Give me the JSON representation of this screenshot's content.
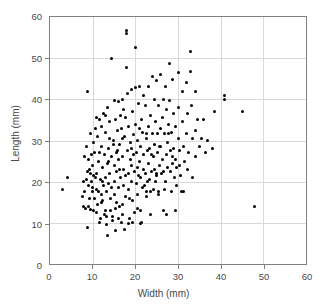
{
  "chart_data": {
    "type": "scatter",
    "title": "",
    "xlabel": "Width (mm)",
    "ylabel": "Length (mm)",
    "xlim": [
      0,
      60
    ],
    "ylim": [
      0,
      60
    ],
    "xticks": [
      0,
      10,
      20,
      30,
      40,
      50,
      60
    ],
    "yticks": [
      0,
      10,
      20,
      30,
      40,
      50,
      60
    ],
    "grid": true,
    "legend": null,
    "marker": {
      "shape": "circle",
      "color": "#000000",
      "size_px": 3
    },
    "series": [
      {
        "name": "specimens",
        "points": [
          [
            3.0,
            18.0
          ],
          [
            4.0,
            21.0
          ],
          [
            7.5,
            16.5
          ],
          [
            7.8,
            14.0
          ],
          [
            8.0,
            17.5
          ],
          [
            8.2,
            26.0
          ],
          [
            8.3,
            13.5
          ],
          [
            8.5,
            28.5
          ],
          [
            8.6,
            20.5
          ],
          [
            8.7,
            8.8
          ],
          [
            8.8,
            41.8
          ],
          [
            9.0,
            25.5
          ],
          [
            9.0,
            14.0
          ],
          [
            9.2,
            16.0
          ],
          [
            9.4,
            22.0
          ],
          [
            9.5,
            31.8
          ],
          [
            9.6,
            13.3
          ],
          [
            9.7,
            20.0
          ],
          [
            9.8,
            26.5
          ],
          [
            10.0,
            17.5
          ],
          [
            10.0,
            24.0
          ],
          [
            10.2,
            21.5
          ],
          [
            10.3,
            13.0
          ],
          [
            10.4,
            27.0
          ],
          [
            10.5,
            16.0
          ],
          [
            10.6,
            33.0
          ],
          [
            10.8,
            35.5
          ],
          [
            11.0,
            18.0
          ],
          [
            11.0,
            22.0
          ],
          [
            11.2,
            14.5
          ],
          [
            11.4,
            25.0
          ],
          [
            11.5,
            10.0
          ],
          [
            11.6,
            27.0
          ],
          [
            11.8,
            20.5
          ],
          [
            12.0,
            33.5
          ],
          [
            12.0,
            17.0
          ],
          [
            12.2,
            23.5
          ],
          [
            12.4,
            15.5
          ],
          [
            12.5,
            36.5
          ],
          [
            12.6,
            19.0
          ],
          [
            12.8,
            26.5
          ],
          [
            13.0,
            32.0
          ],
          [
            13.0,
            21.0
          ],
          [
            13.1,
            13.0
          ],
          [
            13.2,
            17.5
          ],
          [
            13.3,
            9.5
          ],
          [
            13.4,
            24.5
          ],
          [
            13.5,
            38.0
          ],
          [
            13.5,
            7.0
          ],
          [
            13.6,
            28.0
          ],
          [
            13.8,
            19.5
          ],
          [
            14.0,
            34.5
          ],
          [
            14.0,
            22.0
          ],
          [
            14.2,
            16.0
          ],
          [
            14.4,
            26.0
          ],
          [
            14.5,
            49.8
          ],
          [
            14.6,
            11.5
          ],
          [
            14.8,
            30.0
          ],
          [
            15.0,
            39.8
          ],
          [
            15.0,
            20.0
          ],
          [
            15.1,
            24.0
          ],
          [
            15.2,
            17.0
          ],
          [
            15.3,
            35.0
          ],
          [
            15.4,
            13.5
          ],
          [
            15.5,
            27.0
          ],
          [
            15.6,
            22.5
          ],
          [
            15.8,
            32.5
          ],
          [
            16.0,
            39.5
          ],
          [
            16.0,
            18.5
          ],
          [
            16.1,
            25.5
          ],
          [
            16.2,
            14.0
          ],
          [
            16.4,
            29.0
          ],
          [
            16.5,
            36.0
          ],
          [
            16.6,
            21.0
          ],
          [
            16.8,
            33.0
          ],
          [
            17.0,
            40.0
          ],
          [
            17.0,
            12.0
          ],
          [
            17.1,
            26.0
          ],
          [
            17.2,
            19.0
          ],
          [
            17.3,
            23.0
          ],
          [
            17.4,
            31.0
          ],
          [
            17.5,
            8.5
          ],
          [
            17.6,
            35.5
          ],
          [
            17.8,
            16.5
          ],
          [
            17.9,
            47.8
          ],
          [
            18.0,
            56.8
          ],
          [
            18.0,
            56.0
          ],
          [
            18.1,
            41.5
          ],
          [
            18.2,
            27.5
          ],
          [
            18.3,
            22.0
          ],
          [
            18.4,
            18.0
          ],
          [
            18.5,
            33.5
          ],
          [
            18.6,
            11.0
          ],
          [
            18.8,
            29.5
          ],
          [
            19.0,
            42.5
          ],
          [
            19.0,
            24.0
          ],
          [
            19.2,
            20.0
          ],
          [
            19.3,
            37.0
          ],
          [
            19.4,
            15.5
          ],
          [
            19.5,
            26.5
          ],
          [
            19.6,
            31.5
          ],
          [
            19.8,
            22.5
          ],
          [
            20.0,
            52.5
          ],
          [
            20.0,
            42.8
          ],
          [
            20.1,
            34.0
          ],
          [
            20.2,
            27.0
          ],
          [
            20.3,
            19.5
          ],
          [
            20.4,
            23.5
          ],
          [
            20.5,
            30.0
          ],
          [
            20.6,
            17.0
          ],
          [
            20.8,
            39.0
          ],
          [
            21.0,
            43.0
          ],
          [
            21.0,
            25.0
          ],
          [
            21.1,
            21.0
          ],
          [
            21.2,
            28.5
          ],
          [
            21.3,
            13.0
          ],
          [
            21.4,
            35.0
          ],
          [
            21.5,
            10.0
          ],
          [
            21.6,
            32.0
          ],
          [
            21.8,
            23.0
          ],
          [
            22.0,
            41.0
          ],
          [
            22.0,
            26.5
          ],
          [
            22.2,
            19.0
          ],
          [
            22.3,
            38.5
          ],
          [
            22.4,
            22.0
          ],
          [
            22.5,
            30.5
          ],
          [
            22.6,
            16.5
          ],
          [
            22.8,
            27.5
          ],
          [
            23.0,
            43.0
          ],
          [
            23.0,
            24.5
          ],
          [
            23.2,
            33.5
          ],
          [
            23.3,
            20.5
          ],
          [
            23.4,
            28.0
          ],
          [
            23.5,
            12.0
          ],
          [
            23.6,
            36.0
          ],
          [
            23.8,
            22.5
          ],
          [
            24.0,
            45.5
          ],
          [
            24.0,
            31.8
          ],
          [
            24.2,
            26.0
          ],
          [
            24.3,
            18.0
          ],
          [
            24.4,
            23.0
          ],
          [
            24.5,
            40.0
          ],
          [
            24.6,
            29.0
          ],
          [
            24.8,
            34.5
          ],
          [
            25.0,
            44.5
          ],
          [
            25.0,
            21.5
          ],
          [
            25.2,
            27.0
          ],
          [
            25.3,
            31.8
          ],
          [
            25.4,
            17.5
          ],
          [
            25.5,
            38.5
          ],
          [
            25.6,
            24.0
          ],
          [
            25.8,
            33.0
          ],
          [
            26.0,
            46.0
          ],
          [
            26.0,
            28.5
          ],
          [
            26.2,
            22.0
          ],
          [
            26.3,
            35.5
          ],
          [
            26.4,
            25.5
          ],
          [
            26.5,
            13.0
          ],
          [
            26.6,
            40.0
          ],
          [
            26.8,
            31.8
          ],
          [
            27.0,
            43.0
          ],
          [
            27.0,
            20.0
          ],
          [
            27.2,
            26.5
          ],
          [
            27.3,
            12.0
          ],
          [
            27.4,
            37.5
          ],
          [
            27.5,
            23.5
          ],
          [
            27.6,
            29.5
          ],
          [
            27.8,
            34.0
          ],
          [
            28.0,
            48.8
          ],
          [
            28.0,
            39.8
          ],
          [
            28.2,
            22.5
          ],
          [
            28.3,
            27.5
          ],
          [
            28.4,
            17.5
          ],
          [
            28.5,
            32.0
          ],
          [
            28.6,
            24.5
          ],
          [
            28.8,
            44.8
          ],
          [
            29.0,
            36.5
          ],
          [
            29.0,
            28.0
          ],
          [
            29.2,
            21.0
          ],
          [
            29.3,
            13.0
          ],
          [
            29.4,
            25.5
          ],
          [
            29.5,
            33.5
          ],
          [
            29.6,
            19.0
          ],
          [
            30.0,
            46.5
          ],
          [
            30.0,
            38.0
          ],
          [
            30.2,
            30.5
          ],
          [
            30.3,
            24.0
          ],
          [
            30.4,
            27.5
          ],
          [
            30.5,
            21.5
          ],
          [
            31.0,
            41.8
          ],
          [
            31.0,
            34.5
          ],
          [
            31.2,
            28.5
          ],
          [
            31.3,
            17.5
          ],
          [
            31.5,
            25.0
          ],
          [
            32.0,
            44.0
          ],
          [
            32.0,
            31.8
          ],
          [
            32.2,
            23.0
          ],
          [
            32.3,
            36.5
          ],
          [
            32.5,
            27.0
          ],
          [
            33.0,
            51.5
          ],
          [
            33.0,
            46.8
          ],
          [
            33.2,
            38.5
          ],
          [
            33.3,
            30.5
          ],
          [
            33.5,
            21.0
          ],
          [
            34.0,
            42.0
          ],
          [
            34.0,
            32.5
          ],
          [
            34.2,
            26.0
          ],
          [
            34.5,
            35.0
          ],
          [
            35.0,
            28.5
          ],
          [
            35.5,
            30.5
          ],
          [
            36.0,
            35.0
          ],
          [
            36.5,
            27.0
          ],
          [
            37.0,
            30.0
          ],
          [
            38.0,
            28.0
          ],
          [
            38.5,
            37.0
          ],
          [
            41.0,
            41.0
          ],
          [
            41.0,
            40.0
          ],
          [
            45.0,
            37.0
          ],
          [
            48.0,
            14.0
          ],
          [
            9.1,
            19.0
          ],
          [
            10.1,
            29.5
          ],
          [
            11.1,
            31.0
          ],
          [
            12.1,
            28.5
          ],
          [
            12.9,
            36.0
          ],
          [
            13.7,
            25.0
          ],
          [
            14.3,
            18.5
          ],
          [
            14.9,
            29.0
          ],
          [
            15.7,
            15.0
          ],
          [
            16.3,
            23.0
          ],
          [
            16.9,
            30.5
          ],
          [
            17.7,
            21.5
          ],
          [
            18.7,
            16.0
          ],
          [
            19.1,
            28.0
          ],
          [
            19.7,
            12.5
          ],
          [
            20.7,
            21.5
          ],
          [
            21.7,
            18.5
          ],
          [
            22.7,
            31.8
          ],
          [
            23.7,
            26.5
          ],
          [
            24.7,
            20.0
          ],
          [
            25.7,
            28.5
          ],
          [
            26.7,
            22.5
          ],
          [
            27.7,
            31.8
          ],
          [
            28.7,
            26.0
          ],
          [
            29.7,
            23.5
          ],
          [
            9.3,
            23.0
          ],
          [
            10.7,
            21.0
          ],
          [
            11.7,
            35.0
          ],
          [
            12.3,
            20.0
          ],
          [
            13.9,
            30.5
          ],
          [
            15.9,
            27.5
          ],
          [
            17.3,
            37.5
          ],
          [
            18.9,
            25.5
          ],
          [
            20.9,
            33.0
          ],
          [
            22.9,
            20.0
          ],
          [
            24.9,
            22.0
          ],
          [
            26.9,
            18.0
          ],
          [
            11.3,
            17.5
          ],
          [
            12.7,
            12.0
          ],
          [
            14.7,
            10.5
          ],
          [
            16.7,
            10.0
          ],
          [
            18.3,
            9.8
          ],
          [
            15.3,
            8.2
          ],
          [
            19.3,
            10.0
          ],
          [
            21.3,
            9.8
          ],
          [
            10.9,
            12.5
          ],
          [
            11.9,
            11.0
          ],
          [
            13.3,
            11.5
          ],
          [
            12.1,
            15.0
          ],
          [
            14.1,
            13.0
          ],
          [
            16.1,
            11.0
          ],
          [
            17.1,
            14.5
          ],
          [
            9.9,
            18.5
          ],
          [
            8.9,
            22.5
          ],
          [
            7.9,
            20.0
          ],
          [
            20.5,
            13.5
          ],
          [
            22.5,
            17.5
          ],
          [
            23.5,
            17.5
          ],
          [
            25.5,
            17.0
          ],
          [
            30.8,
            17.5
          ]
        ]
      }
    ]
  }
}
